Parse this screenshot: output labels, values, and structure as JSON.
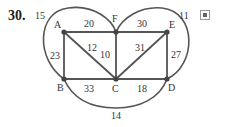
{
  "problem_number": "30.",
  "graph": {
    "vertices": [
      {
        "id": "A",
        "x": 64,
        "y": 32,
        "lx": 54,
        "ly": 28
      },
      {
        "id": "F",
        "x": 116,
        "y": 32,
        "lx": 112,
        "ly": 22
      },
      {
        "id": "E",
        "x": 167,
        "y": 32,
        "lx": 169,
        "ly": 28
      },
      {
        "id": "B",
        "x": 64,
        "y": 79,
        "lx": 57,
        "ly": 91
      },
      {
        "id": "C",
        "x": 116,
        "y": 79,
        "lx": 112,
        "ly": 92
      },
      {
        "id": "D",
        "x": 167,
        "y": 79,
        "lx": 168,
        "ly": 91
      }
    ],
    "edges": [
      {
        "from": "A",
        "to": "F",
        "weight": "20",
        "lx": 84,
        "ly": 27
      },
      {
        "from": "F",
        "to": "E",
        "weight": "30",
        "lx": 137,
        "ly": 27
      },
      {
        "from": "A",
        "to": "B",
        "weight": "23",
        "lx": 50,
        "ly": 59
      },
      {
        "from": "A",
        "to": "C",
        "weight": "12",
        "lx": 87,
        "ly": 51
      },
      {
        "from": "F",
        "to": "C",
        "weight": "10",
        "lx": 100,
        "ly": 58
      },
      {
        "from": "E",
        "to": "C",
        "weight": "31",
        "lx": 135,
        "ly": 51
      },
      {
        "from": "E",
        "to": "D",
        "weight": "27",
        "lx": 171,
        "ly": 58
      },
      {
        "from": "B",
        "to": "C",
        "weight": "33",
        "lx": 84,
        "ly": 92
      },
      {
        "from": "C",
        "to": "D",
        "weight": "18",
        "lx": 137,
        "ly": 92
      },
      {
        "from": "B",
        "to": "F",
        "weight": "15",
        "curve": "left-loop",
        "lx": 35,
        "ly": 19
      },
      {
        "from": "F",
        "to": "D",
        "weight": "11",
        "curve": "right-loop",
        "lx": 179,
        "ly": 19
      },
      {
        "from": "B",
        "to": "D",
        "weight": "14",
        "curve": "bottom-arc",
        "lx": 111,
        "ly": 119
      }
    ]
  },
  "icon": "expand-icon"
}
